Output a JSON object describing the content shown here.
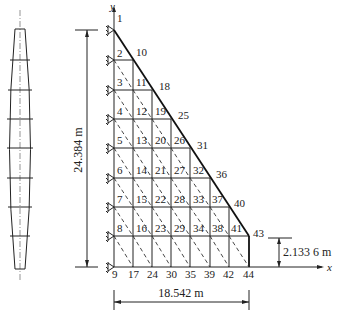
{
  "figure": {
    "type": "finite-element-mesh",
    "axes": {
      "x_label": "x",
      "y_label": "y"
    },
    "dimensions": {
      "height": "24.384 m",
      "base": "18.542 m",
      "crest_height": "2.133 6 m"
    },
    "boundary_rows": [
      1,
      2,
      3,
      4,
      5,
      6,
      7,
      8,
      9
    ],
    "node_labels": [
      {
        "id": "1",
        "x": 117,
        "y": 22
      },
      {
        "id": "2",
        "x": 117,
        "y": 57
      },
      {
        "id": "10",
        "x": 136,
        "y": 56
      },
      {
        "id": "3",
        "x": 117,
        "y": 86
      },
      {
        "id": "11",
        "x": 136,
        "y": 86
      },
      {
        "id": "18",
        "x": 159,
        "y": 90
      },
      {
        "id": "4",
        "x": 117,
        "y": 115
      },
      {
        "id": "12",
        "x": 136,
        "y": 115
      },
      {
        "id": "19",
        "x": 155,
        "y": 115
      },
      {
        "id": "25",
        "x": 178,
        "y": 119
      },
      {
        "id": "5",
        "x": 117,
        "y": 144
      },
      {
        "id": "13",
        "x": 136,
        "y": 144
      },
      {
        "id": "20",
        "x": 155,
        "y": 144
      },
      {
        "id": "26",
        "x": 174,
        "y": 144
      },
      {
        "id": "31",
        "x": 197,
        "y": 149
      },
      {
        "id": "6",
        "x": 117,
        "y": 174
      },
      {
        "id": "14",
        "x": 136,
        "y": 174
      },
      {
        "id": "21",
        "x": 155,
        "y": 174
      },
      {
        "id": "27",
        "x": 174,
        "y": 174
      },
      {
        "id": "32",
        "x": 193,
        "y": 174
      },
      {
        "id": "36",
        "x": 216,
        "y": 178
      },
      {
        "id": "7",
        "x": 117,
        "y": 203
      },
      {
        "id": "15",
        "x": 136,
        "y": 203
      },
      {
        "id": "22",
        "x": 155,
        "y": 203
      },
      {
        "id": "28",
        "x": 174,
        "y": 203
      },
      {
        "id": "33",
        "x": 193,
        "y": 203
      },
      {
        "id": "37",
        "x": 212,
        "y": 203
      },
      {
        "id": "40",
        "x": 234,
        "y": 207
      },
      {
        "id": "8",
        "x": 117,
        "y": 232
      },
      {
        "id": "16",
        "x": 136,
        "y": 232
      },
      {
        "id": "23",
        "x": 155,
        "y": 232
      },
      {
        "id": "29",
        "x": 174,
        "y": 232
      },
      {
        "id": "34",
        "x": 193,
        "y": 232
      },
      {
        "id": "38",
        "x": 212,
        "y": 232
      },
      {
        "id": "41",
        "x": 231,
        "y": 232
      },
      {
        "id": "43",
        "x": 253,
        "y": 237
      },
      {
        "id": "9",
        "x": 112,
        "y": 278
      },
      {
        "id": "17",
        "x": 128,
        "y": 278
      },
      {
        "id": "24",
        "x": 147,
        "y": 278
      },
      {
        "id": "30",
        "x": 166,
        "y": 278
      },
      {
        "id": "35",
        "x": 185,
        "y": 278
      },
      {
        "id": "39",
        "x": 204,
        "y": 278
      },
      {
        "id": "42",
        "x": 223,
        "y": 278
      },
      {
        "id": "44",
        "x": 243,
        "y": 278
      }
    ]
  }
}
